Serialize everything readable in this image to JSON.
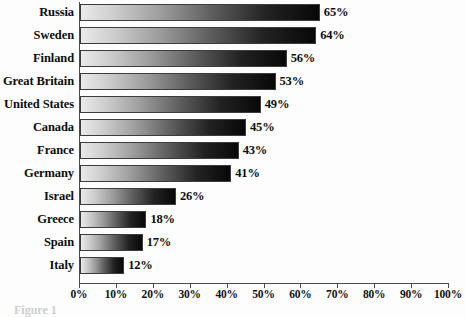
{
  "chart_data": {
    "type": "bar",
    "orientation": "horizontal",
    "title": "",
    "xlabel": "",
    "ylabel": "",
    "categories": [
      "Russia",
      "Sweden",
      "Finland",
      "Great Britain",
      "United States",
      "Canada",
      "France",
      "Germany",
      "Israel",
      "Greece",
      "Spain",
      "Italy"
    ],
    "values": [
      65,
      64,
      56,
      53,
      49,
      45,
      43,
      41,
      26,
      18,
      17,
      12
    ],
    "value_labels": [
      "65%",
      "64%",
      "56%",
      "53%",
      "49%",
      "45%",
      "43%",
      "41%",
      "26%",
      "18%",
      "17%",
      "12%"
    ],
    "xlim": [
      0,
      100
    ],
    "xticks": [
      0,
      10,
      20,
      30,
      40,
      50,
      60,
      70,
      80,
      90,
      100
    ],
    "xtick_labels": [
      "0%",
      "10%",
      "20%",
      "30%",
      "40%",
      "50%",
      "60%",
      "70%",
      "80%",
      "90%",
      "100%"
    ],
    "grid": false,
    "legend": "none",
    "bar_fill": "gradient light-gray to black",
    "bar_color_start": "#eaeaea",
    "bar_color_end": "#080808",
    "bar_border_color": "#3c3c3c",
    "axis_color": "#4a4a4a",
    "background_color": "#fdfdfd",
    "text_color": "#0d0d0d"
  },
  "caption": {
    "text": "Figure 1"
  }
}
